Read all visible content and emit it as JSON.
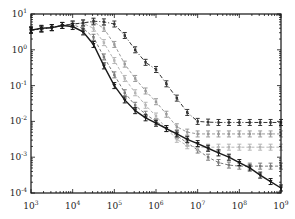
{
  "chart_data": {
    "type": "line",
    "title": "",
    "xlabel": "",
    "ylabel": "",
    "xscale": "log",
    "yscale": "log",
    "xlim": [
      1000,
      1000000000
    ],
    "ylim": [
      0.0001,
      10
    ],
    "grid": false,
    "legend": null,
    "x_tick_labels": [
      "10^3",
      "10^4",
      "10^5",
      "10^6",
      "10^7",
      "10^8",
      "10^9"
    ],
    "y_tick_labels": [
      "10^1",
      "10^0",
      "10^-1",
      "10^-2",
      "10^-3",
      "10^-4"
    ],
    "x_log10": [
      3.0,
      3.25,
      3.5,
      3.75,
      4.0,
      4.25,
      4.5,
      4.75,
      5.0,
      5.25,
      5.5,
      5.75,
      6.0,
      6.25,
      6.5,
      6.75,
      7.0,
      7.25,
      7.5,
      7.75,
      8.0,
      8.25,
      8.5,
      8.75,
      9.0
    ],
    "series": [
      {
        "name": "series-1",
        "style": "solid",
        "color": "#1a1a1a",
        "marker": "triangle",
        "y_log10": [
          0.55,
          0.6,
          0.62,
          0.68,
          0.65,
          0.5,
          0.15,
          -0.45,
          -1.0,
          -1.4,
          -1.7,
          -1.9,
          -2.05,
          -2.2,
          -2.35,
          -2.5,
          -2.62,
          -2.75,
          -2.88,
          -3.0,
          -3.15,
          -3.3,
          -3.5,
          -3.68,
          -3.86
        ]
      },
      {
        "name": "series-2",
        "style": "dashdot",
        "color": "#333333",
        "marker": "errorbar",
        "y_log10": [
          0.55,
          0.58,
          0.62,
          0.68,
          0.72,
          0.75,
          0.8,
          0.78,
          0.72,
          0.4,
          0.0,
          -0.35,
          -0.55,
          -0.95,
          -1.35,
          -1.75,
          -2.0,
          -2.02,
          -2.03,
          -2.03,
          -2.03,
          -2.03,
          -2.03,
          -2.03,
          -2.03
        ]
      },
      {
        "name": "series-3",
        "style": "dashed",
        "color": "#9a9a9a",
        "marker": "errorbar",
        "y_log10": [
          0.55,
          0.58,
          0.62,
          0.68,
          0.72,
          0.75,
          0.78,
          0.6,
          0.15,
          -0.4,
          -0.8,
          -1.15,
          -1.45,
          -1.8,
          -2.15,
          -2.3,
          -2.35,
          -2.35,
          -2.35,
          -2.35,
          -2.35,
          -2.35,
          -2.35,
          -2.35,
          -2.35
        ]
      },
      {
        "name": "series-4",
        "style": "dashed",
        "color": "#b5b5b5",
        "marker": "errorbar",
        "y_log10": [
          0.55,
          0.58,
          0.62,
          0.68,
          0.72,
          0.74,
          0.6,
          0.2,
          -0.3,
          -0.8,
          -1.2,
          -1.55,
          -1.85,
          -2.2,
          -2.5,
          -2.68,
          -2.72,
          -2.72,
          -2.72,
          -2.72,
          -2.72,
          -2.72,
          -2.72,
          -2.72,
          -2.72
        ]
      },
      {
        "name": "series-5",
        "style": "dashed",
        "color": "#7a7a7a",
        "marker": "errorbar",
        "y_log10": [
          0.55,
          0.58,
          0.62,
          0.68,
          0.7,
          0.6,
          0.35,
          -0.2,
          -0.7,
          -1.2,
          -1.55,
          -1.8,
          -2.0,
          -2.2,
          -2.4,
          -2.6,
          -2.8,
          -3.0,
          -3.15,
          -3.22,
          -3.25,
          -3.25,
          -3.25,
          -3.25,
          -3.25
        ]
      }
    ]
  },
  "axes": {
    "frame": {
      "left": 31,
      "right": 281,
      "top": 14,
      "bottom": 193
    }
  }
}
